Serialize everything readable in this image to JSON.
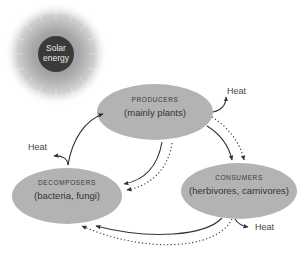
{
  "diagram": {
    "type": "nutrient and energy cycle",
    "sun": {
      "line1": "Solar",
      "line2": "energy"
    },
    "nodes": {
      "producers": {
        "title": "PRODUCERS",
        "subtitle": "(mainly plants)"
      },
      "consumers": {
        "title": "CONSUMERS",
        "subtitle": "(herbivores, carnivores)"
      },
      "decomposers": {
        "title": "DECOMPOSERS",
        "subtitle": "(bacteria, fungi)"
      }
    },
    "heat_labels": {
      "producers": "Heat",
      "decomposers": "Heat",
      "consumers": "Heat"
    },
    "edges": [
      {
        "from": "producers",
        "to": "consumers",
        "style": "solid"
      },
      {
        "from": "producers",
        "to": "consumers",
        "style": "dotted"
      },
      {
        "from": "consumers",
        "to": "decomposers",
        "style": "solid"
      },
      {
        "from": "consumers",
        "to": "decomposers",
        "style": "dotted"
      },
      {
        "from": "producers",
        "to": "decomposers",
        "style": "solid"
      },
      {
        "from": "producers",
        "to": "decomposers",
        "style": "dotted"
      },
      {
        "from": "decomposers",
        "to": "producers",
        "style": "solid"
      }
    ],
    "colors": {
      "node_fill": "#b3b3b3",
      "sun_core": "#3a3a3a",
      "sun_glow": "#9a9a9a",
      "arrow": "#333333"
    }
  }
}
